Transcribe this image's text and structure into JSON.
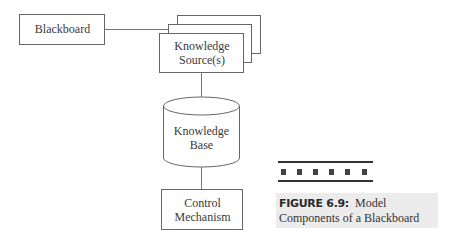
{
  "diagram": {
    "nodes": {
      "blackboard": {
        "label": "Blackboard"
      },
      "knowledge_sources": {
        "label_line1": "Knowledge",
        "label_line2": "Source(s)",
        "stack_count": 3
      },
      "knowledge_base": {
        "label_line1": "Knowledge",
        "label_line2": "Base",
        "shape": "cylinder"
      },
      "control_mechanism": {
        "label_line1": "Control",
        "label_line2": "Mechanism"
      }
    },
    "edges": [
      {
        "from": "blackboard",
        "to": "knowledge_sources"
      },
      {
        "from": "knowledge_sources",
        "to": "knowledge_base"
      },
      {
        "from": "knowledge_base",
        "to": "control_mechanism"
      }
    ]
  },
  "caption": {
    "figure_number": "FIGURE 6.9:",
    "title_part1": "Model",
    "title_part2": "Components of a Blackboard"
  },
  "colors": {
    "stroke": "#555555",
    "caption_bg": "#ececec"
  }
}
